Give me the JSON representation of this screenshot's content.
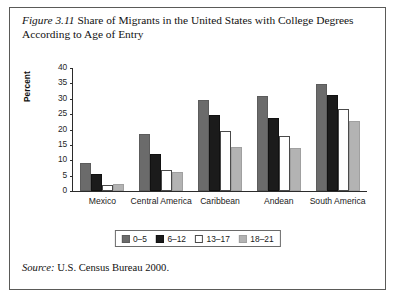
{
  "figure": {
    "number_label": "Figure 3.11",
    "title": "Share of Migrants in the United States with College Degrees According to Age of Entry",
    "source_label": "Source:",
    "source_text": "U.S. Census Bureau 2000."
  },
  "legend": {
    "items": [
      {
        "label": "0–5",
        "color": "#6b6b6b"
      },
      {
        "label": "6–12",
        "color": "#1b1b1b"
      },
      {
        "label": "13–17",
        "color": "#ffffff"
      },
      {
        "label": "18–21",
        "color": "#b3b3b3"
      }
    ]
  },
  "axis": {
    "y_label": "Percent",
    "y_ticks": [
      "0",
      "5",
      "10",
      "15",
      "20",
      "25",
      "30",
      "35",
      "40"
    ]
  },
  "chart_data": {
    "type": "bar",
    "title": "Share of Migrants in the United States with College Degrees According to Age of Entry",
    "xlabel": "",
    "ylabel": "Percent",
    "ylim": [
      0,
      40
    ],
    "ytick_step": 5,
    "grid": false,
    "legend_position": "bottom-center",
    "categories": [
      "Mexico",
      "Central America",
      "Caribbean",
      "Andean",
      "South America"
    ],
    "series": [
      {
        "name": "0–5",
        "color": "#6b6b6b",
        "values": [
          9.0,
          18.5,
          29.2,
          30.7,
          34.6
        ]
      },
      {
        "name": "6–12",
        "color": "#1b1b1b",
        "values": [
          5.5,
          12.1,
          24.5,
          23.4,
          31.1
        ]
      },
      {
        "name": "13–17",
        "color": "#ffffff",
        "values": [
          1.9,
          6.9,
          19.3,
          17.8,
          26.4
        ]
      },
      {
        "name": "18–21",
        "color": "#b3b3b3",
        "values": [
          2.4,
          6.1,
          14.3,
          13.9,
          22.7
        ]
      }
    ]
  }
}
